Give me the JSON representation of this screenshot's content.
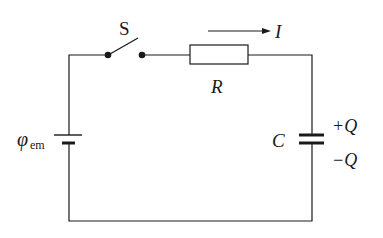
{
  "diagram": {
    "type": "circuit",
    "components": {
      "switch": {
        "label": "S",
        "state": "open"
      },
      "resistor": {
        "label": "R"
      },
      "battery": {
        "label": "φ",
        "subscript": "em"
      },
      "capacitor": {
        "label": "C",
        "plus_label": "+Q",
        "minus_label": "−Q"
      }
    },
    "current": {
      "label": "I",
      "direction": "right"
    },
    "colors": {
      "stroke": "#1a1a1a",
      "background": "#ffffff"
    }
  }
}
